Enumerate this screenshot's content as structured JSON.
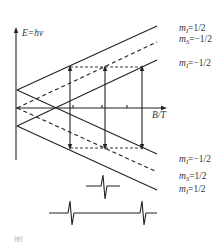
{
  "diagram": {
    "type": "EPR energy-level (Zeeman) diagram with hyperfine splitting",
    "y_axis_label": "E=hν",
    "x_axis_label": "B/T",
    "upper_levels": [
      {
        "label_mI": "m_I=1/2",
        "style": "solid"
      },
      {
        "label_mS": "m_S=−1/2",
        "style": "dashed"
      },
      {
        "label_mI": "m_I=−1/2",
        "style": "solid"
      }
    ],
    "lower_levels": [
      {
        "label_mI": "m_I=−1/2",
        "style": "solid"
      },
      {
        "label_mS": "m_S=1/2",
        "style": "dashed"
      },
      {
        "label_mI": "m_I=1/2",
        "style": "solid"
      }
    ],
    "labels": {
      "top1_sym": "m",
      "top1_sub": "I",
      "top1_val": "=1/2",
      "top2_sym": "m",
      "top2_sub": "S",
      "top2_val": "=−1/2",
      "top3_sym": "m",
      "top3_sub": "I",
      "top3_val": "=−1/2",
      "bot1_sym": "m",
      "bot1_sub": "I",
      "bot1_val": "=−1/2",
      "bot2_sym": "m",
      "bot2_sub": "S",
      "bot2_val": "=1/2",
      "bot3_sym": "m",
      "bot3_sub": "I",
      "bot3_val": "=1/2"
    },
    "transitions": 3,
    "signals": [
      "single line (no hyperfine)",
      "doublet (hyperfine split)"
    ],
    "caption": "图"
  }
}
